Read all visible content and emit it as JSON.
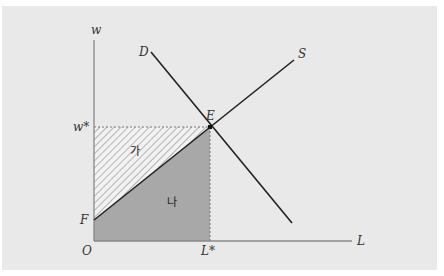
{
  "diagram": {
    "type": "labor market supply-demand diagram",
    "axes": {
      "y_label": "w",
      "x_label": "L",
      "origin_label": "O"
    },
    "curves": [
      {
        "name": "D",
        "description": "labor demand curve, downward sloping"
      },
      {
        "name": "S",
        "description": "labor supply curve, upward sloping from F"
      }
    ],
    "points": {
      "equilibrium": "E",
      "wage_star": "w*",
      "labor_star": "L*",
      "supply_intercept": "F"
    },
    "regions": {
      "upper": "가",
      "lower": "나"
    },
    "colors": {
      "background": "#e9e9e9",
      "lower_fill": "#a8a8a8",
      "lines": "#222222",
      "axes": "#888888"
    }
  }
}
